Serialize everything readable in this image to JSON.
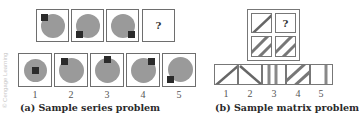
{
  "series_problem": {
    "caption": "(a) Sample series problem",
    "question_mark": "?",
    "sequence": [
      {
        "shape": "circle-with-square",
        "square_position": "top-left"
      },
      {
        "shape": "circle-with-square",
        "square_position": "bottom-left"
      },
      {
        "shape": "circle-with-square",
        "square_position": "bottom-right"
      },
      {
        "shape": "unknown",
        "label": "?"
      }
    ],
    "options": [
      {
        "number": "1",
        "square_position": "center"
      },
      {
        "number": "2",
        "square_position": "top-left"
      },
      {
        "number": "3",
        "square_position": "top-center"
      },
      {
        "number": "4",
        "square_position": "top-right"
      },
      {
        "number": "5",
        "square_position": "bottom-left"
      }
    ]
  },
  "matrix_problem": {
    "caption": "(b) Sample matrix problem",
    "question_mark": "?",
    "cells": [
      {
        "pattern": "diagonal-line"
      },
      {
        "pattern": "unknown",
        "label": "?"
      },
      {
        "pattern": "hatched-diagonal"
      },
      {
        "pattern": "hatched-diagonal"
      }
    ],
    "options": [
      {
        "number": "1",
        "pattern": "diagonal-line"
      },
      {
        "number": "2",
        "pattern": "reverse-diagonal-line"
      },
      {
        "number": "3",
        "pattern": "hatched-vertical"
      },
      {
        "number": "4",
        "pattern": "hatched-diagonal"
      },
      {
        "number": "5",
        "pattern": "vertical-line"
      }
    ]
  },
  "watermark": "© Cengage Learning",
  "colors": {
    "circle": "#9a9a9a",
    "square": "#2b2b2b",
    "border": "#6e6e6e"
  }
}
